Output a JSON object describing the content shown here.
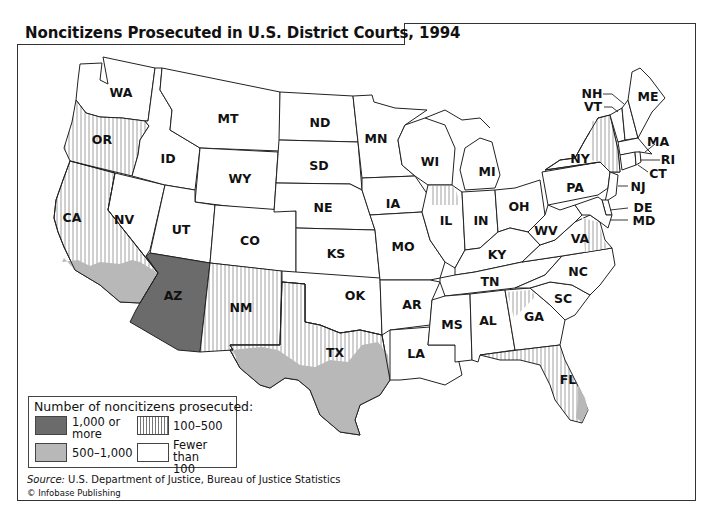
{
  "title": "Noncitizens Prosecuted in U.S. District Courts, 1994",
  "legend": {
    "title": "Number of noncitizens prosecuted:",
    "items": [
      {
        "key": "1000plus",
        "label_line1": "1,000 or",
        "label_line2": "more",
        "style": "dark-gray",
        "color": "#6b6b6b"
      },
      {
        "key": "100-500",
        "label_line1": "100–500",
        "label_line2": "",
        "style": "vertical-hatch",
        "color": "#777777"
      },
      {
        "key": "500-1000",
        "label_line1": "500–1,000",
        "label_line2": "",
        "style": "light-gray",
        "color": "#b8b8b8"
      },
      {
        "key": "lt100",
        "label_line1": "Fewer than",
        "label_line2": "100",
        "style": "white",
        "color": "#ffffff"
      }
    ]
  },
  "source": {
    "label": "Source:",
    "text": " U.S. Department of Justice, Bureau of Justice Statistics"
  },
  "copyright": "© Infobase Publishing",
  "states": [
    {
      "abbr": "WA",
      "category": "lt100"
    },
    {
      "abbr": "OR",
      "category": "100-500"
    },
    {
      "abbr": "CA",
      "category": "100-500",
      "southern_district": "500-1000"
    },
    {
      "abbr": "NV",
      "category": "lt100"
    },
    {
      "abbr": "ID",
      "category": "lt100"
    },
    {
      "abbr": "MT",
      "category": "lt100"
    },
    {
      "abbr": "WY",
      "category": "lt100"
    },
    {
      "abbr": "UT",
      "category": "lt100"
    },
    {
      "abbr": "CO",
      "category": "lt100"
    },
    {
      "abbr": "AZ",
      "category": "1000plus"
    },
    {
      "abbr": "NM",
      "category": "100-500"
    },
    {
      "abbr": "ND",
      "category": "lt100"
    },
    {
      "abbr": "SD",
      "category": "lt100"
    },
    {
      "abbr": "NE",
      "category": "lt100"
    },
    {
      "abbr": "KS",
      "category": "lt100"
    },
    {
      "abbr": "OK",
      "category": "lt100"
    },
    {
      "abbr": "TX",
      "category": "100-500",
      "southern_district": "500-1000"
    },
    {
      "abbr": "MN",
      "category": "lt100"
    },
    {
      "abbr": "IA",
      "category": "lt100"
    },
    {
      "abbr": "MO",
      "category": "lt100"
    },
    {
      "abbr": "AR",
      "category": "lt100"
    },
    {
      "abbr": "LA",
      "category": "lt100"
    },
    {
      "abbr": "WI",
      "category": "lt100"
    },
    {
      "abbr": "IL",
      "category": "lt100",
      "northern_district": "100-500"
    },
    {
      "abbr": "MI",
      "category": "lt100"
    },
    {
      "abbr": "IN",
      "category": "lt100"
    },
    {
      "abbr": "OH",
      "category": "lt100"
    },
    {
      "abbr": "KY",
      "category": "lt100"
    },
    {
      "abbr": "TN",
      "category": "lt100"
    },
    {
      "abbr": "MS",
      "category": "lt100"
    },
    {
      "abbr": "AL",
      "category": "lt100"
    },
    {
      "abbr": "GA",
      "category": "lt100",
      "northern_district": "100-500"
    },
    {
      "abbr": "FL",
      "category": "100-500",
      "southern_district": "500-1000"
    },
    {
      "abbr": "SC",
      "category": "lt100"
    },
    {
      "abbr": "NC",
      "category": "lt100"
    },
    {
      "abbr": "VA",
      "category": "lt100",
      "eastern_district": "100-500"
    },
    {
      "abbr": "WV",
      "category": "lt100"
    },
    {
      "abbr": "PA",
      "category": "lt100"
    },
    {
      "abbr": "NY",
      "category": "lt100",
      "southern_eastern_district": "100-500"
    },
    {
      "abbr": "VT",
      "category": "lt100"
    },
    {
      "abbr": "NH",
      "category": "lt100"
    },
    {
      "abbr": "ME",
      "category": "lt100"
    },
    {
      "abbr": "MA",
      "category": "lt100"
    },
    {
      "abbr": "RI",
      "category": "lt100"
    },
    {
      "abbr": "CT",
      "category": "lt100"
    },
    {
      "abbr": "NJ",
      "category": "lt100"
    },
    {
      "abbr": "DE",
      "category": "lt100"
    },
    {
      "abbr": "MD",
      "category": "lt100"
    }
  ],
  "labels": {
    "WA": "WA",
    "OR": "OR",
    "CA": "CA",
    "NV": "NV",
    "ID": "ID",
    "MT": "MT",
    "WY": "WY",
    "UT": "UT",
    "CO": "CO",
    "AZ": "AZ",
    "NM": "NM",
    "ND": "ND",
    "SD": "SD",
    "NE": "NE",
    "KS": "KS",
    "OK": "OK",
    "TX": "TX",
    "MN": "MN",
    "IA": "IA",
    "MO": "MO",
    "AR": "AR",
    "LA": "LA",
    "WI": "WI",
    "IL": "IL",
    "MI": "MI",
    "IN": "IN",
    "OH": "OH",
    "KY": "KY",
    "TN": "TN",
    "MS": "MS",
    "AL": "AL",
    "GA": "GA",
    "FL": "FL",
    "SC": "SC",
    "NC": "NC",
    "VA": "VA",
    "WV": "WV",
    "PA": "PA",
    "NY": "NY",
    "VT": "VT",
    "NH": "NH",
    "ME": "ME",
    "MA": "MA",
    "RI": "RI",
    "CT": "CT",
    "NJ": "NJ",
    "DE": "DE",
    "MD": "MD"
  }
}
